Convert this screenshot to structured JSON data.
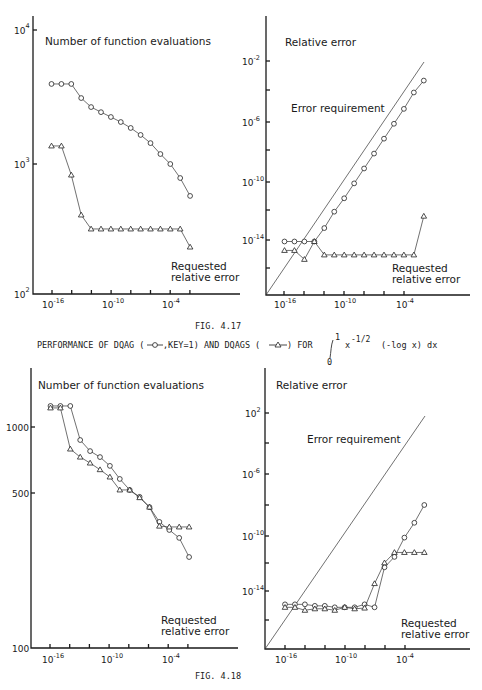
{
  "figures": [
    {
      "caption": "FIG. 4.17",
      "description": "PERFORMANCE OF DQAG (–o–,KEY=1) AND DQAGS (–△–) FOR",
      "integral": {
        "lower": "0",
        "upper": "1",
        "integrand": "x",
        "exponent": "-1/2",
        "rest": "(-log x) dx"
      }
    },
    {
      "caption": "FIG. 4.18"
    }
  ],
  "labels": {
    "evals_title": "Number of function evaluations",
    "relerr_title": "Relative error",
    "error_requirement": "Error requirement",
    "requested_1": "Requested",
    "requested_2": "relative error",
    "fig1_caption": "FIG. 4.17",
    "fig1_desc_a": "PERFORMANCE OF DQAG (",
    "fig1_desc_b": ",KEY=1) AND DQAGS (",
    "fig1_desc_c": ") FOR",
    "integral_upper": "1",
    "integral_lower": "0",
    "integrand": "x",
    "integrand_exp": "-1/2",
    "integrand_rest": "(-log x) dx",
    "fig2_caption": "FIG. 4.18"
  },
  "chart_data": [
    {
      "id": "fig4.17-evals",
      "type": "line",
      "title": "Number of function evaluations",
      "xlabel": "Requested relative error",
      "ylabel": "",
      "xscale": "log",
      "yscale": "log",
      "x_exponents": [
        -16,
        -15,
        -14,
        -13,
        -12,
        -11,
        -10,
        -9,
        -8,
        -7,
        -6,
        -5,
        -4,
        -3,
        -2
      ],
      "xticks": [
        "10^-16",
        "10^-10",
        "10^-4"
      ],
      "yticks": [
        "10^2",
        "10^3",
        "10^4"
      ],
      "ylim": [
        100,
        10000
      ],
      "series": [
        {
          "name": "DQAG (KEY=1)",
          "marker": "circle",
          "values": [
            4040,
            4040,
            4040,
            3160,
            2700,
            2470,
            2270,
            2080,
            1875,
            1660,
            1440,
            1190,
            1000,
            783,
            573
          ]
        },
        {
          "name": "DQAGS",
          "marker": "triangle",
          "values": [
            1370,
            1370,
            825,
            411,
            322,
            322,
            322,
            322,
            322,
            322,
            322,
            322,
            322,
            322,
            235
          ]
        }
      ]
    },
    {
      "id": "fig4.17-relerr",
      "type": "line",
      "title": "Relative error",
      "annotation": "Error requirement",
      "xlabel": "Requested relative error",
      "xscale": "log",
      "yscale": "log",
      "x_exponents": [
        -16,
        -15,
        -14,
        -13,
        -12,
        -11,
        -10,
        -9,
        -8,
        -7,
        -6,
        -5,
        -4,
        -3,
        -2
      ],
      "xticks": [
        "10^-16",
        "10^-10",
        "10^-4"
      ],
      "yticks": [
        "10^-14",
        "10^-10",
        "10^-6",
        "10^-2"
      ],
      "ylim_exponent": [
        -18,
        1
      ],
      "series": [
        {
          "name": "Error requirement",
          "marker": "none",
          "log10_values": "y = x"
        },
        {
          "name": "DQAG (KEY=1)",
          "marker": "circle",
          "log10_values": [
            -14.1,
            -14.1,
            -14.1,
            -14.1,
            -13.2,
            -12.1,
            -11.2,
            -10.2,
            -9.2,
            -8.2,
            -7.2,
            -6.2,
            -5.2,
            -4.1,
            -3.3
          ]
        },
        {
          "name": "DQAGS",
          "marker": "triangle",
          "log10_values": [
            -14.7,
            -14.7,
            -15.3,
            -14.1,
            -15.0,
            -15.0,
            -15.0,
            -15.0,
            -15.0,
            -15.0,
            -15.0,
            -15.0,
            -15.0,
            -15.0,
            -12.4
          ]
        }
      ]
    },
    {
      "id": "fig4.18-evals",
      "type": "line",
      "title": "Number of function evaluations",
      "xlabel": "Requested relative error",
      "xscale": "log",
      "yscale": "log",
      "x_exponents": [
        -16,
        -15,
        -14,
        -13,
        -12,
        -11,
        -10,
        -9,
        -8,
        -7,
        -6,
        -5,
        -4,
        -3,
        -2
      ],
      "xticks": [
        "10^-16",
        "10^-10",
        "10^-4"
      ],
      "yticks": [
        "100",
        "500",
        "1000"
      ],
      "ylim": [
        100,
        1500
      ],
      "series": [
        {
          "name": "DQAG (KEY=1)",
          "marker": "circle",
          "values": [
            1245,
            1245,
            1245,
            873,
            778,
            731,
            667,
            582,
            519,
            483,
            434,
            372,
            342,
            315,
            258
          ]
        },
        {
          "name": "DQAGS",
          "marker": "triangle",
          "values": [
            1220,
            1220,
            795,
            731,
            687,
            641,
            594,
            519,
            519,
            479,
            434,
            356,
            353,
            353,
            353
          ]
        }
      ]
    },
    {
      "id": "fig4.18-relerr",
      "type": "line",
      "title": "Relative error",
      "annotation": "Error requirement",
      "xlabel": "Requested relative error",
      "xscale": "log",
      "yscale": "log",
      "x_exponents": [
        -16,
        -15,
        -14,
        -13,
        -12,
        -11,
        -10,
        -9,
        -8,
        -7,
        -6,
        -5,
        -4,
        -3,
        -2
      ],
      "xticks": [
        "10^-16",
        "10^-10",
        "10^-4"
      ],
      "yticks": [
        "10^-14",
        "10^-10",
        "10^-6",
        "10^-2"
      ],
      "ylim_exponent": [
        -18,
        2
      ],
      "series": [
        {
          "name": "Error requirement",
          "marker": "none",
          "log10_values": "y = x"
        },
        {
          "name": "DQAG (KEY=1)",
          "marker": "circle",
          "log10_values": [
            -14.9,
            -14.9,
            -14.9,
            -15.0,
            -15.0,
            -15.1,
            -15.1,
            -15.1,
            -14.9,
            -15.1,
            -12.4,
            -11.7,
            -10.4,
            -9.4,
            -8.2
          ]
        },
        {
          "name": "DQAGS",
          "marker": "triangle",
          "log10_values": [
            -15.1,
            -15.1,
            -15.3,
            -15.2,
            -15.2,
            -15.3,
            -15.1,
            -15.2,
            -15.15,
            -13.5,
            -12.1,
            -11.4,
            -11.4,
            -11.4,
            -11.4
          ]
        }
      ]
    }
  ]
}
